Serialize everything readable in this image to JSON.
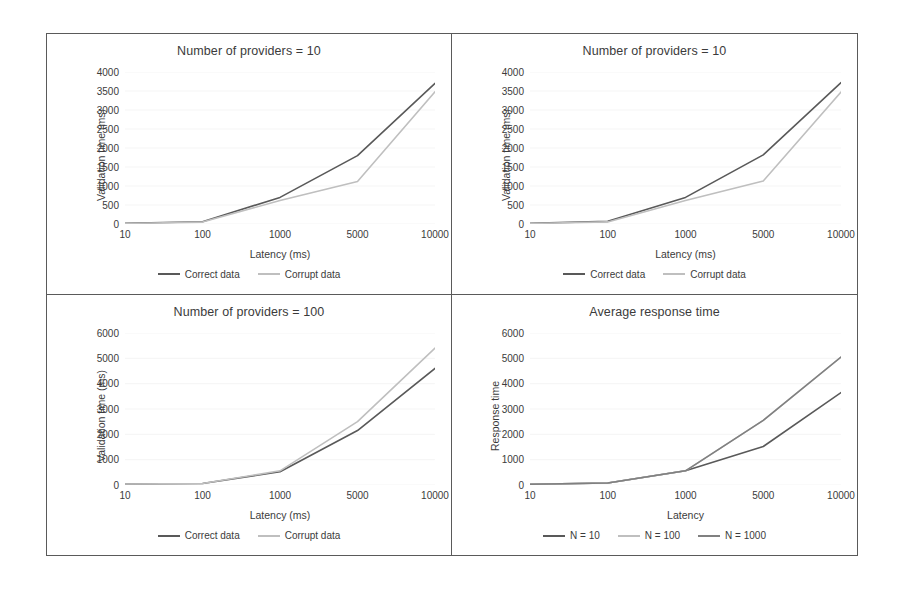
{
  "figure": {
    "background": "#ffffff",
    "border_color": "#5a5a5a"
  },
  "colors": {
    "dark": "#595959",
    "light": "#bfbfbf",
    "medium": "#808080",
    "text": "#3b3b3b",
    "grid": "#e6e6e6"
  },
  "panels": [
    {
      "id": "providers-10-a",
      "title": "Number of providers = 10",
      "legend": [
        {
          "label": "Correct data",
          "color": "#595959"
        },
        {
          "label": "Corrupt data",
          "color": "#bfbfbf"
        }
      ]
    },
    {
      "id": "providers-10-b",
      "title": "Number of providers = 10",
      "legend": [
        {
          "label": "Correct data",
          "color": "#595959"
        },
        {
          "label": "Corrupt data",
          "color": "#bfbfbf"
        }
      ]
    },
    {
      "id": "providers-100",
      "title": "Number of providers = 100",
      "legend": [
        {
          "label": "Correct data",
          "color": "#595959"
        },
        {
          "label": "Corrupt data",
          "color": "#bfbfbf"
        }
      ]
    },
    {
      "id": "average-response-time",
      "title": "Average response time",
      "legend": [
        {
          "label": "N = 10",
          "color": "#595959"
        },
        {
          "label": "N = 100",
          "color": "#bfbfbf"
        },
        {
          "label": "N = 1000",
          "color": "#808080"
        }
      ]
    }
  ],
  "chart_data": [
    {
      "id": "providers-10-a",
      "type": "line",
      "title": "Number of providers = 10",
      "xlabel": "Latency (ms)",
      "ylabel": "Validation time (ms)",
      "categories": [
        "10",
        "100",
        "1000",
        "5000",
        "10000"
      ],
      "yticks": [
        0,
        500,
        1000,
        1500,
        2000,
        2500,
        3000,
        3500,
        4000
      ],
      "ylim": [
        0,
        4000
      ],
      "grid": true,
      "legend_position": "bottom",
      "series": [
        {
          "name": "Correct data",
          "color": "#595959",
          "values": [
            20,
            60,
            700,
            1800,
            3700
          ]
        },
        {
          "name": "Corrupt data",
          "color": "#bfbfbf",
          "values": [
            15,
            50,
            620,
            1120,
            3480
          ]
        }
      ]
    },
    {
      "id": "providers-10-b",
      "type": "line",
      "title": "Number of providers = 10",
      "xlabel": "Latency (ms)",
      "ylabel": "Validation time (ms)",
      "categories": [
        "10",
        "100",
        "1000",
        "5000",
        "10000"
      ],
      "yticks": [
        0,
        500,
        1000,
        1500,
        2000,
        2500,
        3000,
        3500,
        4000
      ],
      "ylim": [
        0,
        4000
      ],
      "grid": true,
      "legend_position": "bottom",
      "series": [
        {
          "name": "Correct data",
          "color": "#595959",
          "values": [
            20,
            70,
            700,
            1820,
            3720
          ]
        },
        {
          "name": "Corrupt data",
          "color": "#bfbfbf",
          "values": [
            15,
            55,
            620,
            1130,
            3470
          ]
        }
      ]
    },
    {
      "id": "providers-100",
      "type": "line",
      "title": "Number of providers = 100",
      "xlabel": "Latency (ms)",
      "ylabel": "Validation time (ms)",
      "categories": [
        "10",
        "100",
        "1000",
        "5000",
        "10000"
      ],
      "yticks": [
        0,
        1000,
        2000,
        3000,
        4000,
        5000,
        6000
      ],
      "ylim": [
        0,
        6000
      ],
      "grid": true,
      "legend_position": "bottom",
      "series": [
        {
          "name": "Correct data",
          "color": "#595959",
          "values": [
            40,
            60,
            520,
            2150,
            4600
          ]
        },
        {
          "name": "Corrupt data",
          "color": "#bfbfbf",
          "values": [
            40,
            60,
            560,
            2500,
            5400
          ]
        }
      ]
    },
    {
      "id": "average-response-time",
      "type": "line",
      "title": "Average response time",
      "xlabel": "Latency",
      "ylabel": "Response time",
      "categories": [
        "10",
        "100",
        "1000",
        "5000",
        "10000"
      ],
      "yticks": [
        0,
        1000,
        2000,
        3000,
        4000,
        5000,
        6000
      ],
      "ylim": [
        0,
        6000
      ],
      "grid": true,
      "legend_position": "bottom",
      "series": [
        {
          "name": "N = 10",
          "color": "#595959",
          "values": [
            30,
            80,
            560,
            1520,
            3650
          ]
        },
        {
          "name": "N = 100",
          "color": "#bfbfbf",
          "values": [
            30,
            80,
            560,
            2550,
            5050
          ]
        },
        {
          "name": "N = 1000",
          "color": "#808080",
          "values": [
            30,
            80,
            560,
            2550,
            5050
          ]
        }
      ]
    }
  ]
}
